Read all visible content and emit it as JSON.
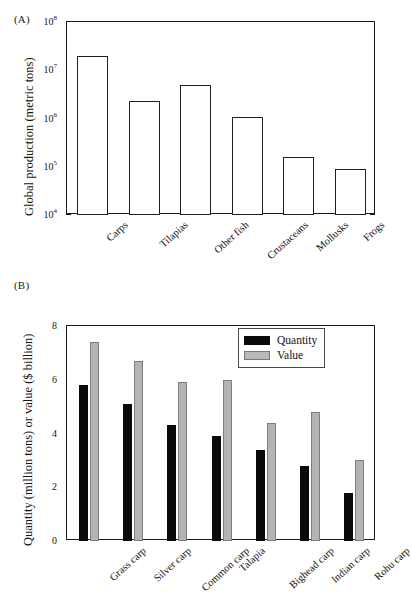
{
  "figure": {
    "panel_a_tag": "(A)",
    "panel_b_tag": "(B)"
  },
  "chart_data": [
    {
      "type": "bar",
      "panel": "(A)",
      "title": "",
      "xlabel": "",
      "ylabel": "Global production (metric tons)",
      "yscale": "log",
      "ylim": [
        10000,
        100000000
      ],
      "ytick_labels": [
        "10⁸",
        "10⁷",
        "10⁶",
        "10⁵",
        "10⁴"
      ],
      "ytick_values": [
        100000000,
        10000000,
        1000000,
        100000,
        10000
      ],
      "ytick_mantissa": [
        "10",
        "10",
        "10",
        "10",
        "10"
      ],
      "ytick_exponent": [
        "8",
        "7",
        "6",
        "5",
        "4"
      ],
      "grid": false,
      "legend": "none",
      "bar_style": "hollow-outline",
      "categories": [
        "Carps",
        "Tilapias",
        "Other fish",
        "Crustaceans",
        "Mollusks",
        "Frogs"
      ],
      "values": [
        20000000,
        2300000,
        5000000,
        1100000,
        160000,
        90000
      ]
    },
    {
      "type": "bar",
      "panel": "(B)",
      "title": "",
      "xlabel": "",
      "ylabel": "Quantity (million tons) or value ($ billion)",
      "yscale": "linear",
      "ylim": [
        0,
        8
      ],
      "ytick_labels": [
        "8",
        "6",
        "4",
        "2",
        "0"
      ],
      "ytick_values": [
        8,
        6,
        4,
        2,
        0
      ],
      "grid": false,
      "legend_position": "top-right",
      "categories": [
        "Grass carp",
        "Silver carp",
        "Common carp",
        "Talapia",
        "Bighead carp",
        "Indian carp",
        "Rohu carp"
      ],
      "series": [
        {
          "name": "Quantity",
          "color": "#0a0a0a",
          "values": [
            5.8,
            5.1,
            4.3,
            3.9,
            3.4,
            2.8,
            1.8
          ]
        },
        {
          "name": "Value",
          "color": "#b4b4b4",
          "values": [
            7.4,
            6.7,
            5.9,
            6.0,
            4.4,
            4.8,
            3.0
          ]
        }
      ]
    }
  ]
}
